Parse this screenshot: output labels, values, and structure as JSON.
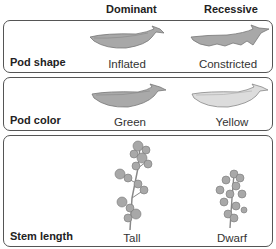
{
  "headers": {
    "dominant": "Dominant",
    "recessive": "Recessive"
  },
  "rows": [
    {
      "trait": "Pod shape",
      "dominant": {
        "label": "Inflated",
        "icon": "inflated-pod-icon"
      },
      "recessive": {
        "label": "Constricted",
        "icon": "constricted-pod-icon"
      }
    },
    {
      "trait": "Pod color",
      "dominant": {
        "label": "Green",
        "icon": "green-pod-icon"
      },
      "recessive": {
        "label": "Yellow",
        "icon": "yellow-pod-icon"
      }
    },
    {
      "trait": "Stem length",
      "dominant": {
        "label": "Tall",
        "icon": "tall-plant-icon"
      },
      "recessive": {
        "label": "Dwarf",
        "icon": "dwarf-plant-icon"
      }
    }
  ],
  "colors": {
    "pod_green": "#a9a9a9",
    "pod_yellow": "#d9d9d9",
    "outline": "#555555"
  }
}
